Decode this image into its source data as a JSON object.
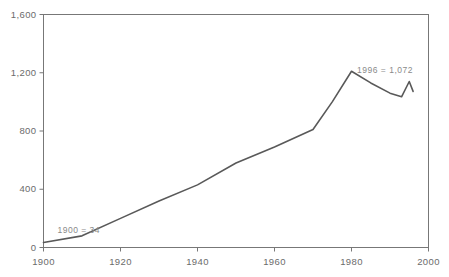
{
  "chart_data": {
    "type": "line",
    "title": "",
    "xlabel": "",
    "ylabel": "",
    "xlim": [
      1900,
      2000
    ],
    "ylim": [
      0,
      1600
    ],
    "grid": false,
    "legend": null,
    "xticks": [
      "1900",
      "1920",
      "1940",
      "1960",
      "1980",
      "2000"
    ],
    "xtick_values": [
      1900,
      1920,
      1940,
      1960,
      1980,
      2000
    ],
    "yticks": [
      "0",
      "400",
      "800",
      "1,200",
      "1,600"
    ],
    "ytick_values": [
      0,
      400,
      800,
      1200,
      1600
    ],
    "series": [
      {
        "name": "value",
        "color": "#595959",
        "x": [
          1900,
          1910,
          1920,
          1930,
          1940,
          1950,
          1960,
          1970,
          1975,
          1980,
          1985,
          1990,
          1993,
          1995,
          1996
        ],
        "values": [
          34,
          80,
          200,
          320,
          430,
          580,
          690,
          810,
          1000,
          1210,
          1130,
          1060,
          1035,
          1140,
          1072
        ]
      }
    ],
    "annotations": [
      {
        "text": "1900 = 34",
        "x": 1900,
        "y": 34,
        "color": "#8a8a8a"
      },
      {
        "text": "1996 = 1,072",
        "x": 1996,
        "y": 1072,
        "color": "#8a8a8a"
      }
    ]
  },
  "axis": {
    "line_color": "#777777",
    "background": "#ffffff"
  }
}
